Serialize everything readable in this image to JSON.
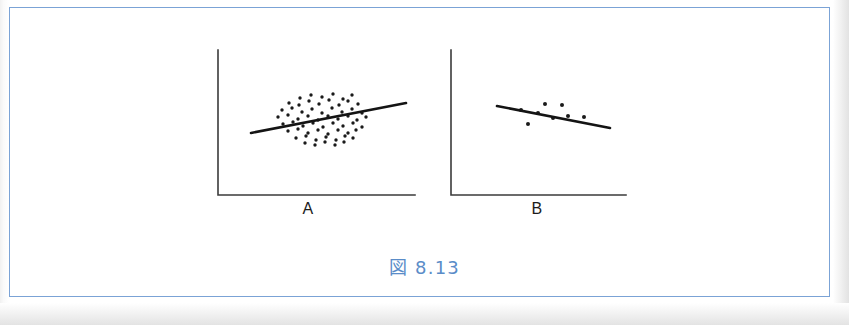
{
  "figure": {
    "caption": "図 8.13",
    "caption_color": "#5a8cc8",
    "frame_color": "#7ba3d6",
    "background_color": "#ffffff",
    "ink_color": "#1a1a1a"
  },
  "panels": [
    {
      "id": "A",
      "label": "A",
      "label_x": 308,
      "label_y": 200,
      "axis": {
        "origin_x": 218,
        "origin_y": 195,
        "y_top": 50,
        "x_right": 415,
        "color": "#3b3b3b",
        "width": 1.6
      },
      "trend_line": {
        "x1": 251,
        "y1": 133,
        "x2": 406,
        "y2": 103,
        "color": "#141414",
        "width": 2.6
      }
    },
    {
      "id": "B",
      "label": "B",
      "label_x": 537,
      "label_y": 200,
      "axis": {
        "origin_x": 451,
        "origin_y": 195,
        "y_top": 50,
        "x_right": 626,
        "color": "#3b3b3b",
        "width": 1.6
      },
      "trend_line": {
        "x1": 497,
        "y1": 106,
        "x2": 610,
        "y2": 128,
        "color": "#141414",
        "width": 2.6
      }
    }
  ],
  "chart_data": {
    "type": "scatter",
    "title": "図 8.13",
    "xlabel": "",
    "ylabel": "",
    "grid": false,
    "legend": "none",
    "panels": [
      {
        "name": "A",
        "label": "A",
        "description": "large sample scatter with weak positive trend line",
        "point_count": 62,
        "point_radius": 1.7,
        "points": [
          [
            300,
            98
          ],
          [
            311,
            95
          ],
          [
            322,
            97
          ],
          [
            333,
            94
          ],
          [
            343,
            99
          ],
          [
            352,
            95
          ],
          [
            289,
            103
          ],
          [
            299,
            105
          ],
          [
            309,
            101
          ],
          [
            319,
            104
          ],
          [
            329,
            100
          ],
          [
            339,
            105
          ],
          [
            348,
            101
          ],
          [
            358,
            104
          ],
          [
            282,
            110
          ],
          [
            292,
            108
          ],
          [
            302,
            112
          ],
          [
            312,
            109
          ],
          [
            322,
            113
          ],
          [
            332,
            108
          ],
          [
            342,
            112
          ],
          [
            352,
            109
          ],
          [
            362,
            113
          ],
          [
            278,
            117
          ],
          [
            288,
            115
          ],
          [
            298,
            119
          ],
          [
            308,
            116
          ],
          [
            318,
            120
          ],
          [
            328,
            116
          ],
          [
            338,
            119
          ],
          [
            348,
            116
          ],
          [
            357,
            120
          ],
          [
            366,
            117
          ],
          [
            283,
            124
          ],
          [
            293,
            122
          ],
          [
            303,
            126
          ],
          [
            313,
            123
          ],
          [
            323,
            127
          ],
          [
            333,
            123
          ],
          [
            343,
            126
          ],
          [
            353,
            123
          ],
          [
            362,
            127
          ],
          [
            288,
            131
          ],
          [
            298,
            129
          ],
          [
            308,
            133
          ],
          [
            318,
            130
          ],
          [
            328,
            134
          ],
          [
            338,
            130
          ],
          [
            348,
            133
          ],
          [
            356,
            130
          ],
          [
            296,
            138
          ],
          [
            306,
            136
          ],
          [
            316,
            140
          ],
          [
            326,
            137
          ],
          [
            336,
            140
          ],
          [
            345,
            136
          ],
          [
            305,
            143
          ],
          [
            315,
            145
          ],
          [
            325,
            142
          ],
          [
            335,
            145
          ],
          [
            344,
            142
          ],
          [
            353,
            138
          ]
        ],
        "trend": "positive-weak"
      },
      {
        "name": "B",
        "label": "B",
        "description": "small sample scatter with weak negative trend line",
        "point_count": 8,
        "point_radius": 2.0,
        "points": [
          [
            521,
            110
          ],
          [
            538,
            113
          ],
          [
            545,
            104
          ],
          [
            562,
            105
          ],
          [
            553,
            118
          ],
          [
            568,
            116
          ],
          [
            584,
            117
          ],
          [
            528,
            124
          ]
        ],
        "trend": "negative-weak"
      }
    ]
  }
}
